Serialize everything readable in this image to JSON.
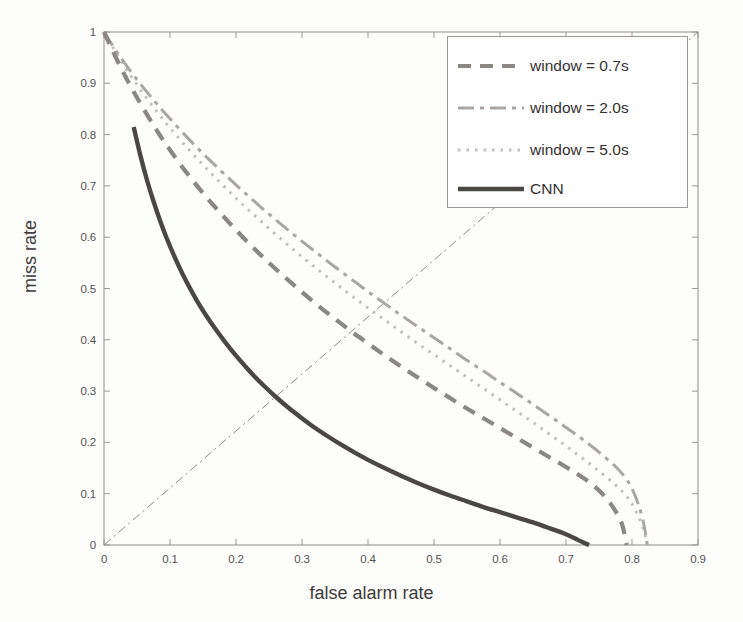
{
  "chart_data": {
    "type": "line",
    "title": "",
    "xlabel": "false alarm rate",
    "ylabel": "miss rate",
    "xlim": [
      0,
      0.9
    ],
    "ylim": [
      0,
      1
    ],
    "xticks": [
      "0",
      "0.1",
      "0.2",
      "0.3",
      "0.4",
      "0.5",
      "0.6",
      "0.7",
      "0.8",
      "0.9"
    ],
    "xtick_values": [
      0,
      0.1,
      0.2,
      0.3,
      0.4,
      0.5,
      0.6,
      0.7,
      0.8,
      0.9
    ],
    "yticks": [
      "0",
      "0.1",
      "0.2",
      "0.3",
      "0.4",
      "0.5",
      "0.6",
      "0.7",
      "0.8",
      "0.9",
      "1"
    ],
    "ytick_values": [
      0,
      0.1,
      0.2,
      0.3,
      0.4,
      0.5,
      0.6,
      0.7,
      0.8,
      0.9,
      1
    ],
    "grid": false,
    "legend_position": "top-right",
    "series": [
      {
        "name": "window = 0.7s",
        "style": "dashed",
        "color": "#8a8785",
        "width": 4.2,
        "dash": "13,9",
        "points": [
          [
            0.0,
            1.0
          ],
          [
            0.02,
            0.945
          ],
          [
            0.04,
            0.895
          ],
          [
            0.06,
            0.85
          ],
          [
            0.08,
            0.808
          ],
          [
            0.1,
            0.77
          ],
          [
            0.125,
            0.726
          ],
          [
            0.15,
            0.686
          ],
          [
            0.175,
            0.649
          ],
          [
            0.2,
            0.614
          ],
          [
            0.225,
            0.581
          ],
          [
            0.25,
            0.55
          ],
          [
            0.275,
            0.521
          ],
          [
            0.3,
            0.493
          ],
          [
            0.325,
            0.466
          ],
          [
            0.35,
            0.441
          ],
          [
            0.375,
            0.416
          ],
          [
            0.4,
            0.393
          ],
          [
            0.425,
            0.37
          ],
          [
            0.45,
            0.348
          ],
          [
            0.475,
            0.327
          ],
          [
            0.5,
            0.306
          ],
          [
            0.525,
            0.286
          ],
          [
            0.55,
            0.266
          ],
          [
            0.575,
            0.247
          ],
          [
            0.6,
            0.228
          ],
          [
            0.625,
            0.209
          ],
          [
            0.65,
            0.19
          ],
          [
            0.675,
            0.171
          ],
          [
            0.7,
            0.152
          ],
          [
            0.72,
            0.136
          ],
          [
            0.74,
            0.118
          ],
          [
            0.76,
            0.093
          ],
          [
            0.775,
            0.066
          ],
          [
            0.785,
            0.04
          ],
          [
            0.79,
            0.012
          ],
          [
            0.792,
            0.0
          ]
        ]
      },
      {
        "name": "window = 2.0s",
        "style": "dash-dot",
        "color": "#a9a6a3",
        "width": 3.0,
        "dash": "16,6,4,6",
        "points": [
          [
            0.0,
            1.0
          ],
          [
            0.02,
            0.96
          ],
          [
            0.04,
            0.924
          ],
          [
            0.06,
            0.891
          ],
          [
            0.08,
            0.86
          ],
          [
            0.1,
            0.831
          ],
          [
            0.125,
            0.796
          ],
          [
            0.15,
            0.763
          ],
          [
            0.175,
            0.732
          ],
          [
            0.2,
            0.702
          ],
          [
            0.225,
            0.673
          ],
          [
            0.25,
            0.645
          ],
          [
            0.275,
            0.618
          ],
          [
            0.3,
            0.592
          ],
          [
            0.325,
            0.567
          ],
          [
            0.35,
            0.542
          ],
          [
            0.375,
            0.518
          ],
          [
            0.4,
            0.494
          ],
          [
            0.425,
            0.471
          ],
          [
            0.45,
            0.448
          ],
          [
            0.475,
            0.426
          ],
          [
            0.5,
            0.404
          ],
          [
            0.525,
            0.382
          ],
          [
            0.55,
            0.36
          ],
          [
            0.575,
            0.339
          ],
          [
            0.6,
            0.317
          ],
          [
            0.625,
            0.296
          ],
          [
            0.65,
            0.274
          ],
          [
            0.675,
            0.252
          ],
          [
            0.7,
            0.229
          ],
          [
            0.725,
            0.206
          ],
          [
            0.75,
            0.181
          ],
          [
            0.775,
            0.153
          ],
          [
            0.79,
            0.131
          ],
          [
            0.8,
            0.11
          ],
          [
            0.81,
            0.078
          ],
          [
            0.818,
            0.04
          ],
          [
            0.822,
            0.01
          ],
          [
            0.823,
            0.0
          ]
        ]
      },
      {
        "name": "window = 5.0s",
        "style": "dotted",
        "color": "#c2bfbc",
        "width": 3.0,
        "dash": "2.5,6",
        "points": [
          [
            0.0,
            1.0
          ],
          [
            0.02,
            0.956
          ],
          [
            0.04,
            0.916
          ],
          [
            0.06,
            0.879
          ],
          [
            0.08,
            0.845
          ],
          [
            0.1,
            0.813
          ],
          [
            0.125,
            0.776
          ],
          [
            0.15,
            0.741
          ],
          [
            0.175,
            0.708
          ],
          [
            0.2,
            0.676
          ],
          [
            0.225,
            0.646
          ],
          [
            0.25,
            0.617
          ],
          [
            0.275,
            0.589
          ],
          [
            0.3,
            0.562
          ],
          [
            0.325,
            0.536
          ],
          [
            0.35,
            0.511
          ],
          [
            0.375,
            0.486
          ],
          [
            0.4,
            0.462
          ],
          [
            0.425,
            0.439
          ],
          [
            0.45,
            0.416
          ],
          [
            0.475,
            0.393
          ],
          [
            0.5,
            0.371
          ],
          [
            0.525,
            0.349
          ],
          [
            0.55,
            0.327
          ],
          [
            0.575,
            0.305
          ],
          [
            0.6,
            0.283
          ],
          [
            0.625,
            0.261
          ],
          [
            0.65,
            0.239
          ],
          [
            0.675,
            0.216
          ],
          [
            0.7,
            0.193
          ],
          [
            0.725,
            0.169
          ],
          [
            0.75,
            0.144
          ],
          [
            0.775,
            0.117
          ],
          [
            0.79,
            0.098
          ],
          [
            0.8,
            0.08
          ],
          [
            0.81,
            0.055
          ],
          [
            0.818,
            0.028
          ],
          [
            0.822,
            0.006
          ],
          [
            0.823,
            0.0
          ]
        ]
      },
      {
        "name": "CNN",
        "style": "solid",
        "color": "#4a4745",
        "width": 4.4,
        "dash": "",
        "points": [
          [
            0.045,
            0.815
          ],
          [
            0.055,
            0.76
          ],
          [
            0.065,
            0.712
          ],
          [
            0.075,
            0.67
          ],
          [
            0.085,
            0.632
          ],
          [
            0.095,
            0.598
          ],
          [
            0.11,
            0.553
          ],
          [
            0.125,
            0.513
          ],
          [
            0.14,
            0.478
          ],
          [
            0.155,
            0.447
          ],
          [
            0.17,
            0.419
          ],
          [
            0.185,
            0.393
          ],
          [
            0.2,
            0.369
          ],
          [
            0.215,
            0.347
          ],
          [
            0.23,
            0.326
          ],
          [
            0.245,
            0.307
          ],
          [
            0.26,
            0.289
          ],
          [
            0.28,
            0.267
          ],
          [
            0.3,
            0.247
          ],
          [
            0.32,
            0.228
          ],
          [
            0.34,
            0.211
          ],
          [
            0.36,
            0.195
          ],
          [
            0.38,
            0.18
          ],
          [
            0.4,
            0.166
          ],
          [
            0.425,
            0.15
          ],
          [
            0.45,
            0.135
          ],
          [
            0.475,
            0.121
          ],
          [
            0.5,
            0.108
          ],
          [
            0.525,
            0.096
          ],
          [
            0.55,
            0.085
          ],
          [
            0.575,
            0.074
          ],
          [
            0.6,
            0.064
          ],
          [
            0.625,
            0.054
          ],
          [
            0.65,
            0.044
          ],
          [
            0.67,
            0.035
          ],
          [
            0.69,
            0.026
          ],
          [
            0.705,
            0.018
          ],
          [
            0.718,
            0.01
          ],
          [
            0.728,
            0.004
          ],
          [
            0.735,
            0.0
          ]
        ]
      }
    ],
    "reference_line": {
      "name": "equal error rate diagonal",
      "style": "dash-dot",
      "color": "#8d8a88",
      "width": 1.0,
      "dash": "9,4,2,4",
      "points": [
        [
          0.0,
          0.0
        ],
        [
          0.9,
          1.0
        ]
      ]
    },
    "annotations": []
  },
  "axes": {
    "x_axis_label": "false alarm rate",
    "y_axis_label": "miss rate"
  },
  "legend": {
    "entries": [
      {
        "label": "window = 0.7s",
        "marker": "dashed-line-swatch"
      },
      {
        "label": "window = 2.0s",
        "marker": "dash-dot-line-swatch"
      },
      {
        "label": "window = 5.0s",
        "marker": "dotted-line-swatch"
      },
      {
        "label": "CNN",
        "marker": "solid-line-swatch"
      }
    ]
  },
  "colors": {
    "background": "#fdfdfc",
    "axis": "#9b9896",
    "tick_text": "#555150",
    "label_text": "#3f3c3b",
    "cnn": "#4a4745",
    "window_07": "#8a8785",
    "window_20": "#a9a6a3",
    "window_50": "#c2bfbc"
  }
}
